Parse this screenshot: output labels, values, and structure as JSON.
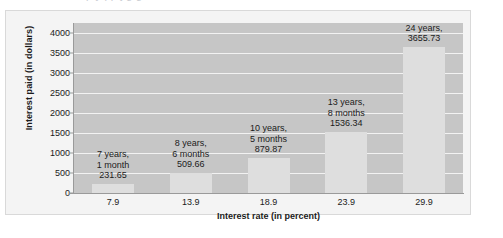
{
  "chart_data": {
    "type": "bar",
    "title": "",
    "xlabel": "Interest rate (in percent)",
    "ylabel": "Interest paid (in dollars)",
    "categories": [
      "7.9",
      "13.9",
      "18.9",
      "23.9",
      "29.9"
    ],
    "values": [
      231.65,
      509.66,
      879.87,
      1536.34,
      3655.73
    ],
    "ylim": [
      0,
      4250
    ],
    "yticks": [
      0,
      500,
      1000,
      1500,
      2000,
      2500,
      3000,
      3500,
      4000
    ],
    "ytick_labels": [
      "0",
      "500",
      "1000",
      "1500",
      "2000",
      "2500",
      "3000",
      "3500",
      "4000"
    ],
    "grid": true,
    "legend": false,
    "bar_labels": [
      {
        "line1": "7 years,",
        "line2": "1 month",
        "line3": "231.65"
      },
      {
        "line1": "8 years,",
        "line2": "6 months",
        "line3": "509.66"
      },
      {
        "line1": "10 years,",
        "line2": "5 months",
        "line3": "879.87"
      },
      {
        "line1": "13 years,",
        "line2": "8 months",
        "line3": "1536.34"
      },
      {
        "line1": "24 years,",
        "line2": "3655.73",
        "line3": ""
      }
    ],
    "colors": {
      "plot_background": "#c6c6c6",
      "bar_fill": "#dedede",
      "gridline": "#f2f2f2",
      "panel_background": "#f4f4f4",
      "axis": "#9a9a9a",
      "text": "#1b1b1b"
    }
  }
}
